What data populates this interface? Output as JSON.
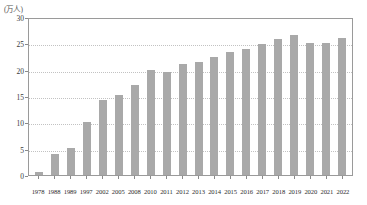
{
  "chart_data": {
    "type": "bar",
    "title": "",
    "subtitle": "",
    "unit_label": "(万人)",
    "xlabel": "",
    "ylabel": "",
    "ylim": [
      0,
      30
    ],
    "ytick_values": [
      0,
      5,
      10,
      15,
      20,
      25,
      30
    ],
    "ytick_labels": [
      "0",
      "5",
      "10",
      "15",
      "20",
      "25",
      "30"
    ],
    "grid": true,
    "grid_style": "dotted-horizontal",
    "legend": "none",
    "bar_color": "#a9a9a9",
    "categories": [
      "1978",
      "1988",
      "1989",
      "1997",
      "2002",
      "2005",
      "2008",
      "2010",
      "2011",
      "2012",
      "2013",
      "2014",
      "2015",
      "2016",
      "2017",
      "2018",
      "2019",
      "2020",
      "2021",
      "2022"
    ],
    "values": [
      0.5,
      4.0,
      5.2,
      10.1,
      14.2,
      15.2,
      17.0,
      20.0,
      19.6,
      21.0,
      21.4,
      22.5,
      23.3,
      24.0,
      24.8,
      25.8,
      26.5,
      25.1,
      25.1,
      26.0
    ]
  }
}
